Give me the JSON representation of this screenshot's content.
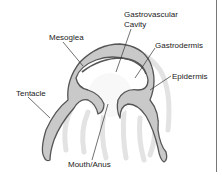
{
  "diagram": {
    "labels": {
      "gastrovascular_line1": "Gastrovascular",
      "gastrovascular_line2": "Cavity",
      "mesoglea": "Mesoglea",
      "gastrodermis": "Gastrodermis",
      "epidermis": "Epidermis",
      "tentacle": "Tentacle",
      "mouth": "Mouth/Anus"
    },
    "colors": {
      "background": "#ffffff",
      "outline": "#555555",
      "mesoglea_fill": "#c9c9c9",
      "ghost_tentacles": "#e2e2e2",
      "cavity_fill": "#f7f7f7",
      "leader_line": "#333333",
      "border_line": "#777777"
    }
  }
}
